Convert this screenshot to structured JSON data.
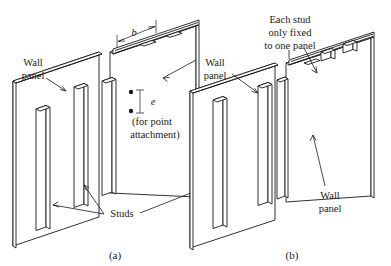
{
  "figure": {
    "background_color": "#ffffff",
    "line_color": "#1a1a1a",
    "captions": [
      {
        "key": "a",
        "text": "(a)",
        "x": 115,
        "y": 259
      },
      {
        "key": "b",
        "text": "(b)",
        "x": 292,
        "y": 259
      }
    ],
    "panel_a": {
      "labels": {
        "wall_panel_left_line1": "Wall",
        "wall_panel_left_line2": "panel",
        "studs": "Studs",
        "dimension_b": "b",
        "dimension_e": "e",
        "point_attachment_line1": "(for point",
        "point_attachment_line2": "attachment)"
      }
    },
    "panel_b": {
      "labels": {
        "each_stud_line1": "Each stud",
        "each_stud_line2": "only fixed",
        "each_stud_line3": "to one panel",
        "wall_panel_upper_line1": "Wall",
        "wall_panel_upper_line2": "panel",
        "wall_panel_lower_line1": "Wall",
        "wall_panel_lower_line2": "panel"
      }
    }
  }
}
